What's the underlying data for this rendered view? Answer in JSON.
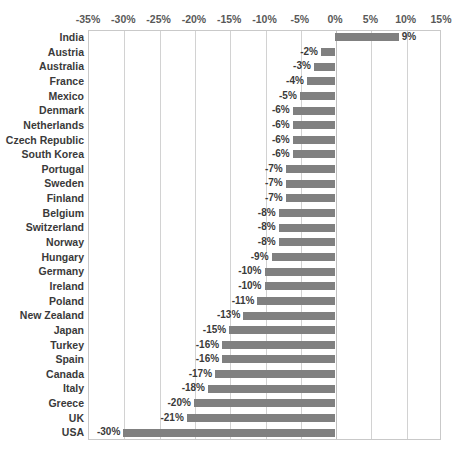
{
  "chart_data": {
    "type": "bar",
    "orientation": "horizontal",
    "title": "",
    "subtitle": "",
    "xlabel": "",
    "ylabel": "",
    "xlim": [
      -35,
      15
    ],
    "xtick_step": 5,
    "grid": true,
    "legend": false,
    "legend_position": "none",
    "value_suffix": "%",
    "bar_color": "#808080",
    "gridline_color": "#d2d2d2",
    "plot_border_color": "#c9c9c9",
    "tick_label_color": "#595959",
    "category_label_color": "#3a3a3a",
    "axis_position": "top",
    "tick_labels": [
      "-35%",
      "-30%",
      "-25%",
      "-20%",
      "-15%",
      "-10%",
      "-5%",
      "0%",
      "5%",
      "10%",
      "15%"
    ],
    "tick_values": [
      -35,
      -30,
      -25,
      -20,
      -15,
      -10,
      -5,
      0,
      5,
      10,
      15
    ],
    "categories": [
      "India",
      "Austria",
      "Australia",
      "France",
      "Mexico",
      "Denmark",
      "Netherlands",
      "Czech Republic",
      "South Korea",
      "Portugal",
      "Sweden",
      "Finland",
      "Belgium",
      "Switzerland",
      "Norway",
      "Hungary",
      "Germany",
      "Ireland",
      "Poland",
      "New Zealand",
      "Japan",
      "Turkey",
      "Spain",
      "Canada",
      "Italy",
      "Greece",
      "UK",
      "USA"
    ],
    "values": [
      9,
      -2,
      -3,
      -4,
      -5,
      -6,
      -6,
      -6,
      -6,
      -7,
      -7,
      -7,
      -8,
      -8,
      -8,
      -9,
      -10,
      -10,
      -11,
      -13,
      -15,
      -16,
      -16,
      -17,
      -18,
      -20,
      -21,
      -30
    ],
    "data_labels": [
      "9%",
      "-2%",
      "-3%",
      "-4%",
      "-5%",
      "-6%",
      "-6%",
      "-6%",
      "-6%",
      "-7%",
      "-7%",
      "-7%",
      "-8%",
      "-8%",
      "-8%",
      "-9%",
      "-10%",
      "-10%",
      "-11%",
      "-13%",
      "-15%",
      "-16%",
      "-16%",
      "-17%",
      "-18%",
      "-20%",
      "-21%",
      "-30%"
    ]
  }
}
